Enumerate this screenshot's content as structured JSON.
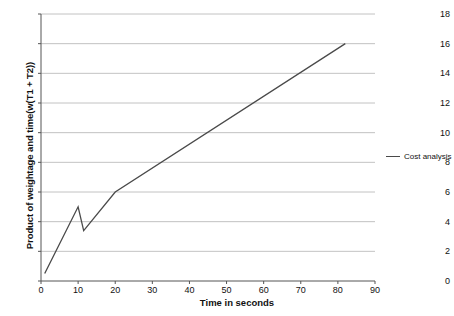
{
  "chart_data": {
    "type": "line",
    "title": "",
    "xlabel": "Time in seconds",
    "ylabel": "Product of weightage and time(w(T1 + T2))",
    "xlim": [
      0,
      90
    ],
    "ylim": [
      0,
      18
    ],
    "xticks": [
      0,
      10,
      20,
      30,
      40,
      50,
      60,
      70,
      80,
      90
    ],
    "yticks": [
      0,
      2,
      4,
      6,
      8,
      10,
      12,
      14,
      16,
      18
    ],
    "grid": "horizontal",
    "legend_position": "right",
    "series": [
      {
        "name": "Cost analysis",
        "color": "#4a4a4a",
        "x": [
          1,
          10,
          11.5,
          20,
          82
        ],
        "y": [
          0.5,
          5.0,
          3.4,
          6.0,
          16.0
        ]
      }
    ]
  },
  "legend": {
    "entries": [
      {
        "label": "Cost analysis",
        "marker": "line-marker"
      }
    ]
  },
  "axis": {
    "y_tick_labels": [
      "0",
      "2",
      "4",
      "6",
      "8",
      "10",
      "12",
      "14",
      "16",
      "18"
    ],
    "x_tick_labels": [
      "0",
      "10",
      "20",
      "30",
      "40",
      "50",
      "60",
      "70",
      "80",
      "90"
    ]
  },
  "colors": {
    "series_line": "#4a4a4a",
    "gridline": "#b3b3b3",
    "axis": "#555555",
    "text": "#111111",
    "background": "#ffffff"
  }
}
